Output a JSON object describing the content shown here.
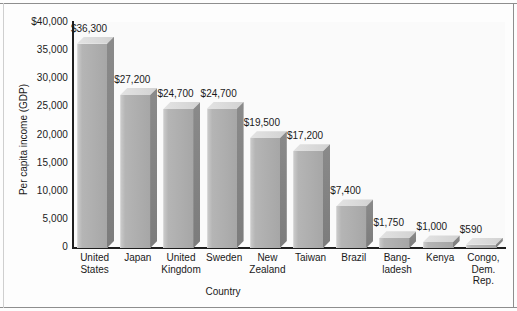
{
  "chart_data": {
    "type": "bar",
    "title": "",
    "xlabel": "Country",
    "ylabel": "Per capita income (GDP)",
    "ylim": [
      0,
      40000
    ],
    "grid": false,
    "legend": "none",
    "style": "3d-vertical-bars",
    "ytick_labels": [
      "$40,000",
      "35,000",
      "30,000",
      "25,000",
      "20,000",
      "15,000",
      "10,000",
      "5,000",
      "0"
    ],
    "ytick_values": [
      40000,
      35000,
      30000,
      25000,
      20000,
      15000,
      10000,
      5000,
      0
    ],
    "categories": [
      "United States",
      "Japan",
      "United Kingdom",
      "Sweden",
      "New Zealand",
      "Taiwan",
      "Brazil",
      "Bangladesh",
      "Kenya",
      "Congo, Dem. Rep."
    ],
    "category_lines": [
      [
        "United",
        "States"
      ],
      [
        "Japan"
      ],
      [
        "United",
        "Kingdom"
      ],
      [
        "Sweden"
      ],
      [
        "New",
        "Zealand"
      ],
      [
        "Taiwan"
      ],
      [
        "Brazil"
      ],
      [
        "Bang-",
        "ladesh"
      ],
      [
        "Kenya"
      ],
      [
        "Congo,",
        "Dem.",
        "Rep."
      ]
    ],
    "values": [
      36300,
      27200,
      24700,
      24700,
      19500,
      17200,
      7400,
      1750,
      1000,
      590
    ],
    "data_labels": [
      "$36,300",
      "$27,200",
      "$24,700",
      "$24,700",
      "$19,500",
      "$17,200",
      "$7,400",
      "$1,750",
      "$1,000",
      "$590"
    ],
    "colors": {
      "bar_front": "#aeaeae",
      "bar_top": "#dcdcdc",
      "bar_side": "#828282",
      "axis": "#1e1e1e",
      "text": "#1a1a1a",
      "plot_background": "#fafafa"
    }
  }
}
